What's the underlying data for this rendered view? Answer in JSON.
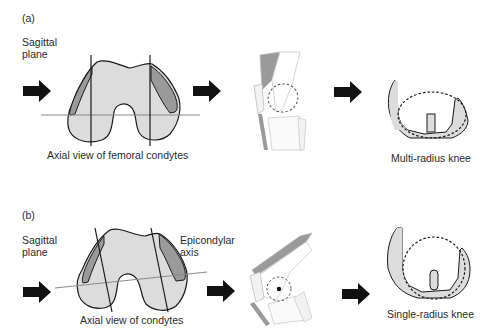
{
  "panel_a": {
    "label": "(a)",
    "plane_label_1": "Sagittal",
    "plane_label_2": "plane",
    "condyle_caption": "Axial view of femoral condytes",
    "knee_caption": "Multi-radius knee"
  },
  "panel_b": {
    "label": "(b)",
    "plane_label_1": "Sagittal",
    "plane_label_2": "plane",
    "axis_label_1": "Epicondylar",
    "axis_label_2": "axis",
    "condyle_caption": "Axial view of condytes",
    "knee_caption": "Single-radius knee"
  },
  "colors": {
    "fill_light": "#dcdcdc",
    "fill_dark": "#9a9a9a",
    "stroke": "#1a1a1a",
    "line_gray": "#8a8a8a",
    "arrow": "#111111"
  }
}
